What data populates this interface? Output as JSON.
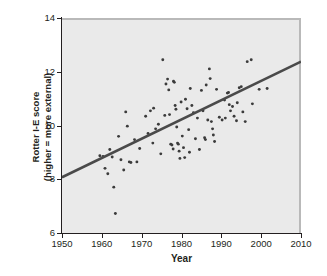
{
  "chart_data": {
    "type": "scatter",
    "title": "",
    "xlabel": "Year",
    "ylabel": "Rotter I-E score (higher = more external)",
    "ylabel_line1": "Rotter I-E score",
    "ylabel_line2": "(higher = more external)",
    "xlim": [
      1950,
      2010
    ],
    "ylim": [
      6,
      14
    ],
    "xticks": [
      1950,
      1960,
      1970,
      1980,
      1990,
      2000,
      2010
    ],
    "yticks": [
      6,
      8,
      10,
      12,
      14
    ],
    "grid": false,
    "legend": "none",
    "panel_background": "#eaeaea",
    "point_color": "#3b3b3b",
    "trendline_color": "#4a4a4a",
    "trendline": {
      "x": [
        1950,
        2010
      ],
      "y": [
        8.15,
        12.45
      ],
      "slope_per_year": 0.0717,
      "label": "least-squares regression line"
    },
    "points": [
      {
        "x": 1959.5,
        "y": 8.95
      },
      {
        "x": 1960.3,
        "y": 8.92
      },
      {
        "x": 1960.8,
        "y": 8.48
      },
      {
        "x": 1961.5,
        "y": 8.28
      },
      {
        "x": 1962.0,
        "y": 9.18
      },
      {
        "x": 1962.6,
        "y": 8.9
      },
      {
        "x": 1963.0,
        "y": 7.78
      },
      {
        "x": 1963.4,
        "y": 6.8
      },
      {
        "x": 1964.2,
        "y": 9.67
      },
      {
        "x": 1964.8,
        "y": 8.8
      },
      {
        "x": 1965.5,
        "y": 8.42
      },
      {
        "x": 1966.0,
        "y": 10.58
      },
      {
        "x": 1966.4,
        "y": 10.05
      },
      {
        "x": 1966.9,
        "y": 8.72
      },
      {
        "x": 1967.3,
        "y": 8.7
      },
      {
        "x": 1968.2,
        "y": 9.55
      },
      {
        "x": 1968.8,
        "y": 8.72
      },
      {
        "x": 1971.0,
        "y": 10.42
      },
      {
        "x": 1971.6,
        "y": 9.78
      },
      {
        "x": 1972.2,
        "y": 10.62
      },
      {
        "x": 1972.8,
        "y": 9.42
      },
      {
        "x": 1973.5,
        "y": 9.95
      },
      {
        "x": 1974.2,
        "y": 10.12
      },
      {
        "x": 1974.8,
        "y": 9.02
      },
      {
        "x": 1975.3,
        "y": 12.52
      },
      {
        "x": 1975.8,
        "y": 10.45
      },
      {
        "x": 1976.1,
        "y": 11.62
      },
      {
        "x": 1976.5,
        "y": 11.8
      },
      {
        "x": 1976.8,
        "y": 11.4
      },
      {
        "x": 1977.0,
        "y": 10.48
      },
      {
        "x": 1977.3,
        "y": 9.38
      },
      {
        "x": 1977.6,
        "y": 9.35
      },
      {
        "x": 1977.9,
        "y": 9.2
      },
      {
        "x": 1978.0,
        "y": 11.72
      },
      {
        "x": 1978.2,
        "y": 11.68
      },
      {
        "x": 1978.4,
        "y": 10.82
      },
      {
        "x": 1978.6,
        "y": 10.68
      },
      {
        "x": 1978.8,
        "y": 10.02
      },
      {
        "x": 1979.0,
        "y": 9.42
      },
      {
        "x": 1979.2,
        "y": 9.38
      },
      {
        "x": 1979.4,
        "y": 9.12
      },
      {
        "x": 1979.6,
        "y": 8.85
      },
      {
        "x": 1979.9,
        "y": 10.95
      },
      {
        "x": 1980.2,
        "y": 9.68
      },
      {
        "x": 1980.5,
        "y": 9.25
      },
      {
        "x": 1980.8,
        "y": 8.88
      },
      {
        "x": 1981.0,
        "y": 11.05
      },
      {
        "x": 1981.4,
        "y": 10.7
      },
      {
        "x": 1981.8,
        "y": 9.92
      },
      {
        "x": 1982.2,
        "y": 11.45
      },
      {
        "x": 1982.6,
        "y": 10.82
      },
      {
        "x": 1983.0,
        "y": 10.55
      },
      {
        "x": 1983.5,
        "y": 9.58
      },
      {
        "x": 1984.0,
        "y": 10.35
      },
      {
        "x": 1984.5,
        "y": 9.18
      },
      {
        "x": 1985.0,
        "y": 11.38
      },
      {
        "x": 1985.4,
        "y": 10.62
      },
      {
        "x": 1985.8,
        "y": 9.62
      },
      {
        "x": 1986.2,
        "y": 11.58
      },
      {
        "x": 1986.6,
        "y": 10.28
      },
      {
        "x": 1987.0,
        "y": 12.18
      },
      {
        "x": 1987.2,
        "y": 11.82
      },
      {
        "x": 1987.5,
        "y": 10.22
      },
      {
        "x": 1987.8,
        "y": 9.95
      },
      {
        "x": 1988.0,
        "y": 9.72
      },
      {
        "x": 1988.3,
        "y": 9.48
      },
      {
        "x": 1988.8,
        "y": 11.42
      },
      {
        "x": 1989.5,
        "y": 10.38
      },
      {
        "x": 1990.2,
        "y": 10.28
      },
      {
        "x": 1991.0,
        "y": 10.35
      },
      {
        "x": 1991.5,
        "y": 11.28
      },
      {
        "x": 1991.8,
        "y": 11.3
      },
      {
        "x": 1992.0,
        "y": 10.85
      },
      {
        "x": 1992.3,
        "y": 10.62
      },
      {
        "x": 1992.8,
        "y": 10.78
      },
      {
        "x": 1993.2,
        "y": 10.42
      },
      {
        "x": 1993.8,
        "y": 10.25
      },
      {
        "x": 1994.5,
        "y": 11.48
      },
      {
        "x": 1995.0,
        "y": 11.52
      },
      {
        "x": 1995.4,
        "y": 10.58
      },
      {
        "x": 1996.0,
        "y": 10.22
      },
      {
        "x": 1996.5,
        "y": 12.45
      },
      {
        "x": 1997.5,
        "y": 12.52
      },
      {
        "x": 1997.8,
        "y": 10.88
      },
      {
        "x": 1999.5,
        "y": 11.42
      },
      {
        "x": 2001.5,
        "y": 11.45
      },
      {
        "x": 1969.5,
        "y": 9.22
      },
      {
        "x": 1973.0,
        "y": 10.72
      },
      {
        "x": 1982.0,
        "y": 9.08
      },
      {
        "x": 1986.0,
        "y": 9.55
      },
      {
        "x": 1990.8,
        "y": 11.02
      },
      {
        "x": 1994.0,
        "y": 10.92
      }
    ]
  },
  "axes": {
    "x_tick_labels": [
      "1950",
      "1960",
      "1970",
      "1980",
      "1990",
      "2000",
      "2010"
    ],
    "y_tick_labels": [
      "6",
      "8",
      "10",
      "12",
      "14"
    ],
    "x_title": "Year",
    "y_title_line1": "Rotter I-E score",
    "y_title_line2": "(higher = more external)"
  }
}
